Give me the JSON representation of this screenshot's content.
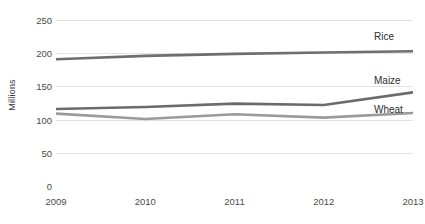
{
  "chart_data": {
    "type": "line",
    "title": "",
    "xlabel": "",
    "ylabel": "Millions",
    "categories": [
      "2009",
      "2010",
      "2011",
      "2012",
      "2013"
    ],
    "x": [
      2009,
      2010,
      2011,
      2012,
      2013
    ],
    "ylim": [
      0,
      250
    ],
    "yticks": [
      0,
      50,
      100,
      150,
      200,
      250
    ],
    "ytick_labels": [
      "0",
      "50",
      "100",
      "150",
      "200",
      "250"
    ],
    "grid": "horizontal",
    "legend_position": "right-inline-end-labels",
    "series": [
      {
        "name": "Rice",
        "values": [
          191,
          196,
          199,
          201,
          203
        ],
        "color": "#6e6e6e",
        "label": "Rice"
      },
      {
        "name": "Maize",
        "values": [
          116,
          119,
          124,
          122,
          141
        ],
        "color": "#6b6b6b",
        "label": "Maize"
      },
      {
        "name": "Wheat",
        "values": [
          109,
          101,
          108,
          103,
          110
        ],
        "color": "#9a9a9a",
        "label": "Wheat"
      }
    ],
    "annotations": [
      {
        "text": "Rice",
        "series": "Rice",
        "value": 225
      },
      {
        "text": "Maize",
        "series": "Maize",
        "value": 155
      },
      {
        "text": "Wheat",
        "series": "Wheat",
        "value": 113
      }
    ],
    "colors": {
      "grid": "#e3e3e3",
      "axis_text": "#4a4a4a",
      "label_text": "#2e2e2e",
      "background": "#ffffff"
    }
  }
}
